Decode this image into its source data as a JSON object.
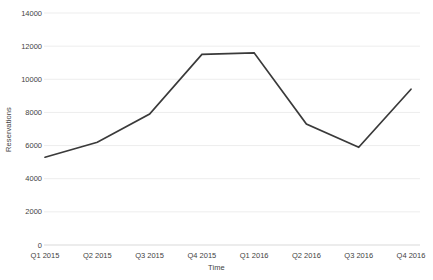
{
  "chart_data": {
    "type": "line",
    "title": "",
    "xlabel": "Time",
    "ylabel": "Reservations",
    "categories": [
      "Q1 2015",
      "Q2 2015",
      "Q3 2015",
      "Q4 2015",
      "Q1 2016",
      "Q2 2016",
      "Q3 2016",
      "Q4 2016"
    ],
    "series": [
      {
        "name": "Reservations",
        "values": [
          5300,
          6200,
          7900,
          11500,
          11600,
          7300,
          5900,
          9400
        ]
      }
    ],
    "ylim": [
      0,
      14000
    ],
    "yticks": [
      0,
      2000,
      4000,
      6000,
      8000,
      10000,
      12000,
      14000
    ],
    "grid": true,
    "legend": "none",
    "colors": {
      "line": "#3a3a3a",
      "gridline": "#ededed",
      "axis_line": "#d9d9d9",
      "text": "#3f3f3f",
      "background": "#ffffff"
    }
  }
}
